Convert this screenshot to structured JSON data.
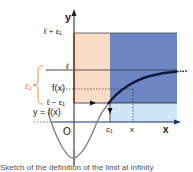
{
  "diagram": {
    "axes": {
      "y_label": "y",
      "x_label": "x",
      "origin_label": "O"
    },
    "y_levels": {
      "upper": "ℓ + ε₁",
      "limit": "ℓ",
      "value": "f(x)",
      "lower": "ℓ − ε₁"
    },
    "x_marks": {
      "c": "c₁",
      "x": "x"
    },
    "epsilon_brace_label": "ε₁",
    "curve_label": "y = f(x)",
    "colors": {
      "band_peach": "#f9dcc6",
      "band_blue": "#6f86c4",
      "band_light_blue": "#cfe6f6",
      "orange_line": "#f07a3a",
      "curve": "#0e1a3c",
      "axis": "#222222",
      "brace": "#f08a4a"
    }
  },
  "caption": {
    "text": "Sketch of the definition of the limit at infinity"
  }
}
